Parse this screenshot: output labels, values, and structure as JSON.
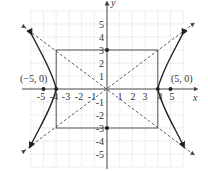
{
  "figure": {
    "type": "hyperbola-graph",
    "equation": "x^2/16 - y^2/9 = 1",
    "axis_labels": {
      "x": "x",
      "y": "y"
    },
    "x_ticks": [
      "-5",
      "-4",
      "-3",
      "-2",
      "-1",
      "1",
      "2",
      "3",
      "4",
      "5"
    ],
    "y_ticks": [
      "5",
      "4",
      "3",
      "2",
      "1",
      "-1",
      "-2",
      "-3",
      "-4",
      "-5"
    ],
    "point_labels": {
      "left_focus": "(−5, 0)",
      "right_focus": "(5, 0)"
    },
    "foci": [
      [
        -5,
        0
      ],
      [
        5,
        0
      ]
    ],
    "vertices": [
      [
        -4,
        0
      ],
      [
        4,
        0
      ]
    ],
    "covertices": [
      [
        0,
        3
      ],
      [
        0,
        -3
      ]
    ],
    "box_corners": [
      [
        -4,
        3
      ],
      [
        4,
        3
      ],
      [
        4,
        -3
      ],
      [
        -4,
        -3
      ]
    ],
    "asymptotes": [
      "y = 3/4 x",
      "y = -3/4 x"
    ],
    "grid_range": {
      "x": [
        -6,
        6
      ],
      "y": [
        -6,
        6
      ]
    },
    "colors": {
      "curve": "#222222",
      "axis": "#444444",
      "grid": "#bbbbbb",
      "box": "#444444",
      "asymptote": "#555555"
    }
  }
}
